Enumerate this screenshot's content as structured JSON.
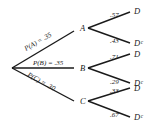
{
  "tree": {
    "root": {
      "x": 12,
      "y": 68
    },
    "first_level": [
      {
        "node": "A",
        "edge_label": "P(A) = .35",
        "x": 76,
        "y": 28,
        "label_x": 88,
        "label_y": 31
      },
      {
        "node": "B",
        "edge_label": "P(B) = .35",
        "x": 76,
        "y": 68,
        "label_x": 88,
        "label_y": 71
      },
      {
        "node": "C",
        "edge_label": "P(C) = .30",
        "x": 76,
        "y": 101,
        "label_x": 88,
        "label_y": 104
      }
    ],
    "second_level": [
      {
        "parent": "A",
        "branches": [
          {
            "node": "D",
            "prob": ".57",
            "x": 128,
            "y": 13
          },
          {
            "node": "Dᶜ",
            "prob": ".43",
            "x": 128,
            "y": 44
          }
        ]
      },
      {
        "parent": "B",
        "branches": [
          {
            "node": "D",
            "prob": ".71",
            "x": 128,
            "y": 56
          },
          {
            "node": "Dᶜ",
            "prob": ".29",
            "x": 128,
            "y": 83
          }
        ]
      },
      {
        "parent": "C",
        "branches": [
          {
            "node": "D",
            "prob": ".33",
            "x": 128,
            "y": 89
          },
          {
            "node": "Dᶜ",
            "prob": ".67",
            "x": 128,
            "y": 118
          }
        ]
      }
    ]
  },
  "labels": {
    "pA": "P(A) = .35",
    "pB": "P(B) = .35",
    "pC": "P(C) = .30",
    "A": "A",
    "B": "B",
    "C": "C",
    "a_d": ".57",
    "a_dc": ".43",
    "b_d": ".71",
    "b_dc": ".29",
    "c_d": ".33",
    "c_dc": ".67",
    "D": "D",
    "Dc": "Dᶜ"
  }
}
